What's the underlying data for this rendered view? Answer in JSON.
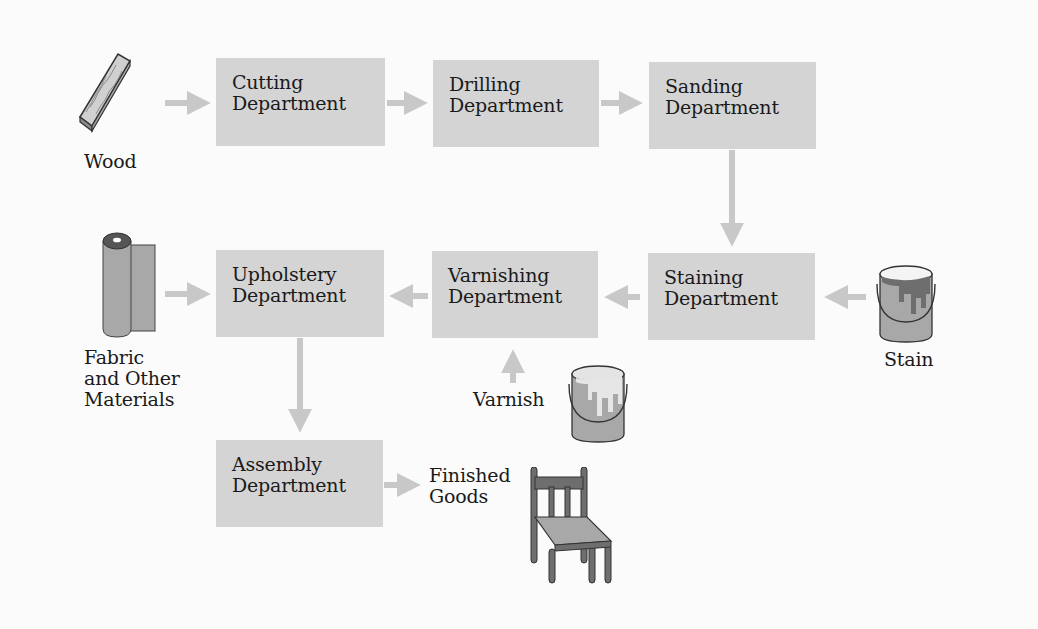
{
  "diagram": {
    "type": "process-flow",
    "colors": {
      "box_fill": "#d4d4d4",
      "arrow": "#c8c8c8",
      "background": "#fbfbfb",
      "icon_fill": "#a8a8a8",
      "icon_dark": "#6e6e6e"
    },
    "departments": [
      {
        "id": "cutting",
        "line1": "Cutting",
        "line2": "Department"
      },
      {
        "id": "drilling",
        "line1": "Drilling",
        "line2": "Department"
      },
      {
        "id": "sanding",
        "line1": "Sanding",
        "line2": "Department"
      },
      {
        "id": "staining",
        "line1": "Staining",
        "line2": "Department"
      },
      {
        "id": "varnishing",
        "line1": "Varnishing",
        "line2": "Department"
      },
      {
        "id": "upholstery",
        "line1": "Upholstery",
        "line2": "Department"
      },
      {
        "id": "assembly",
        "line1": "Assembly",
        "line2": "Department"
      }
    ],
    "inputs": {
      "wood": {
        "label": "Wood",
        "icon": "wood-plank-icon"
      },
      "fabric": {
        "line1": "Fabric",
        "line2": "and Other",
        "line3": "Materials",
        "icon": "fabric-roll-icon"
      },
      "stain": {
        "label": "Stain",
        "icon": "paint-can-icon"
      },
      "varnish": {
        "label": "Varnish",
        "icon": "paint-can-icon"
      }
    },
    "output": {
      "line1": "Finished",
      "line2": "Goods",
      "icon": "chair-icon"
    },
    "flows": [
      [
        "Wood",
        "Cutting Department"
      ],
      [
        "Cutting Department",
        "Drilling Department"
      ],
      [
        "Drilling Department",
        "Sanding Department"
      ],
      [
        "Sanding Department",
        "Staining Department"
      ],
      [
        "Stain",
        "Staining Department"
      ],
      [
        "Staining Department",
        "Varnishing Department"
      ],
      [
        "Varnish",
        "Varnishing Department"
      ],
      [
        "Varnishing Department",
        "Upholstery Department"
      ],
      [
        "Fabric and Other Materials",
        "Upholstery Department"
      ],
      [
        "Upholstery Department",
        "Assembly Department"
      ],
      [
        "Assembly Department",
        "Finished Goods"
      ]
    ]
  }
}
